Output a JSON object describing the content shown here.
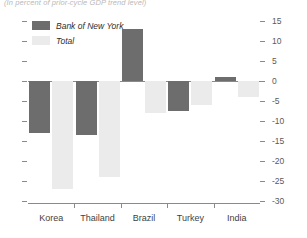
{
  "caption": "(In percent of prior-cycle GDP trend level)",
  "legend": {
    "position": "top-left",
    "entries": [
      {
        "label": "Bank of New York",
        "color": "#6d6d6d",
        "key": "bank_of_new_york"
      },
      {
        "label": "Total",
        "color": "#ebebeb",
        "key": "total"
      }
    ]
  },
  "axis": {
    "y_side": "right",
    "y_ticks": [
      "15",
      "10",
      "5",
      "0",
      "-5",
      "-10",
      "-15",
      "-20",
      "-25",
      "-30"
    ],
    "y_tick_values": [
      15,
      10,
      5,
      0,
      -5,
      -10,
      -15,
      -20,
      -25,
      -30
    ],
    "y_min": -30,
    "y_max": 15,
    "left_ticks_unlabeled": true,
    "grid": false
  },
  "chart_data": {
    "type": "bar",
    "title": "",
    "subtitle": "(In percent of prior-cycle GDP trend level)",
    "xlabel": "",
    "ylabel": "",
    "ylim": [
      -30,
      15
    ],
    "categories": [
      "Korea",
      "Thailand",
      "Brazil",
      "Turkey",
      "India"
    ],
    "series": [
      {
        "name": "Bank of New York",
        "color": "#6d6d6d",
        "values": [
          -13,
          -13.5,
          13,
          -7.5,
          1
        ]
      },
      {
        "name": "Total",
        "color": "#ebebeb",
        "values": [
          -27,
          -24,
          -8,
          -6,
          -4
        ]
      }
    ],
    "legend_position": "top-left",
    "grid": false,
    "zero_line": true
  }
}
